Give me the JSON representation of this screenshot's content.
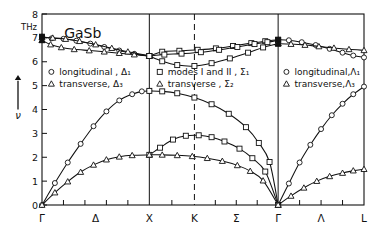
{
  "figure": {
    "title": "GaSb",
    "unit_label": "THz",
    "yaxis_symbol": "ν"
  },
  "chart_data": {
    "type": "line",
    "title": "GaSb",
    "xlabel": "",
    "ylabel": "ν",
    "yunit": "THz",
    "ylim": [
      0,
      8
    ],
    "yticks": [
      0,
      1,
      2,
      3,
      4,
      5,
      6,
      7,
      8
    ],
    "ytick_labels": [
      "0",
      "1",
      "2",
      "3",
      "4",
      "5",
      "6",
      "7",
      "8"
    ],
    "grid": false,
    "legend_position": "inside-upper-left",
    "xlim": [
      0,
      3.0
    ],
    "panel_boundaries": [
      0.0,
      1.0,
      1.42,
      2.2,
      3.0
    ],
    "panel_boundary_styles": [
      "solid",
      "solid",
      "dashed",
      "solid",
      "solid"
    ],
    "xtick_labels": [
      "Γ",
      "Δ",
      "X",
      "K",
      "Σ",
      "Γ",
      "Λ",
      "L"
    ],
    "xtick_positions": [
      0.0,
      0.5,
      1.0,
      1.42,
      1.81,
      2.2,
      2.6,
      3.0
    ],
    "xtick_label_kinds": [
      "point",
      "branch",
      "point",
      "point",
      "branch",
      "point",
      "branch",
      "point"
    ],
    "legend": [
      {
        "marker": "circle-open",
        "label": "longitudinal , Δ₁",
        "column": 1
      },
      {
        "marker": "triangle-open",
        "label": "transverse, Δ₃",
        "column": 1
      },
      {
        "marker": "square-open",
        "label": "modes I and II , Σ₁",
        "column": 2
      },
      {
        "marker": "triangle-open",
        "label": "transverse , Σ₂",
        "column": 2
      },
      {
        "marker": "circle-open",
        "label": "longitudinal,Λ₁",
        "column": 3
      },
      {
        "marker": "triangle-open",
        "label": "transverse,Λ₃",
        "column": 3
      }
    ],
    "series": [
      {
        "name": "LO Δ₁",
        "branch": "optic",
        "segment": "Gamma-X",
        "marker": "circle-open",
        "points": [
          [
            0.0,
            7.05
          ],
          [
            0.09,
            6.98
          ],
          [
            0.2,
            6.96
          ],
          [
            0.32,
            6.88
          ],
          [
            0.45,
            6.76
          ],
          [
            0.58,
            6.62
          ],
          [
            0.72,
            6.47
          ],
          [
            0.86,
            6.33
          ],
          [
            1.0,
            6.24
          ]
        ]
      },
      {
        "name": "TO Δ₃",
        "branch": "optic",
        "segment": "Gamma-X",
        "marker": "triangle-open",
        "points": [
          [
            0.0,
            6.9
          ],
          [
            0.08,
            6.72
          ],
          [
            0.18,
            6.6
          ],
          [
            0.3,
            6.52
          ],
          [
            0.44,
            6.47
          ],
          [
            0.58,
            6.42
          ],
          [
            0.72,
            6.36
          ],
          [
            0.86,
            6.3
          ],
          [
            1.0,
            6.24
          ]
        ]
      },
      {
        "name": "TO Δ₃ upper",
        "branch": "optic",
        "segment": "Gamma-X",
        "marker": "triangle-open",
        "points": [
          [
            0.0,
            7.02
          ],
          [
            0.1,
            7.0
          ],
          [
            0.22,
            6.95
          ],
          [
            0.35,
            6.86
          ],
          [
            0.5,
            6.72
          ],
          [
            0.65,
            6.57
          ],
          [
            0.8,
            6.42
          ],
          [
            1.0,
            6.26
          ]
        ]
      },
      {
        "name": "optic branch A Σ",
        "branch": "optic",
        "segment": "X-K-Sigma-Gamma",
        "marker": "square-open",
        "points": [
          [
            1.0,
            6.24
          ],
          [
            1.12,
            6.42
          ],
          [
            1.28,
            6.46
          ],
          [
            1.45,
            6.5
          ],
          [
            1.62,
            6.56
          ],
          [
            1.78,
            6.66
          ],
          [
            1.95,
            6.78
          ],
          [
            2.08,
            6.86
          ],
          [
            2.2,
            6.92
          ]
        ]
      },
      {
        "name": "optic branch B Σ",
        "branch": "optic",
        "segment": "X-K-Sigma-Gamma",
        "marker": "square-open",
        "points": [
          [
            1.0,
            6.24
          ],
          [
            1.14,
            6.3
          ],
          [
            1.3,
            6.34
          ],
          [
            1.48,
            6.4
          ],
          [
            1.65,
            6.5
          ],
          [
            1.82,
            6.62
          ],
          [
            1.98,
            6.74
          ],
          [
            2.1,
            6.82
          ],
          [
            2.2,
            6.9
          ]
        ]
      },
      {
        "name": "optic branch C Σ",
        "branch": "optic",
        "segment": "X-K-Sigma-Gamma",
        "marker": "square-open",
        "points": [
          [
            1.0,
            6.24
          ],
          [
            1.12,
            6.02
          ],
          [
            1.26,
            5.86
          ],
          [
            1.42,
            5.82
          ],
          [
            1.58,
            5.94
          ],
          [
            1.75,
            6.14
          ],
          [
            1.92,
            6.38
          ],
          [
            2.06,
            6.6
          ],
          [
            2.2,
            6.76
          ]
        ]
      },
      {
        "name": "LO Λ₁",
        "branch": "optic",
        "segment": "Gamma-L",
        "marker": "circle-open",
        "points": [
          [
            2.2,
            6.92
          ],
          [
            2.3,
            6.9
          ],
          [
            2.42,
            6.82
          ],
          [
            2.55,
            6.7
          ],
          [
            2.68,
            6.54
          ],
          [
            2.8,
            6.38
          ],
          [
            2.9,
            6.26
          ],
          [
            3.0,
            6.18
          ]
        ]
      },
      {
        "name": "TO Λ₃",
        "branch": "optic",
        "segment": "Gamma-L",
        "marker": "triangle-open",
        "points": [
          [
            2.2,
            6.76
          ],
          [
            2.32,
            6.74
          ],
          [
            2.45,
            6.7
          ],
          [
            2.58,
            6.64
          ],
          [
            2.72,
            6.58
          ],
          [
            2.86,
            6.52
          ],
          [
            3.0,
            6.48
          ]
        ]
      },
      {
        "name": "LA Δ₁",
        "branch": "acoustic",
        "segment": "Gamma-X",
        "marker": "circle-open",
        "points": [
          [
            0.0,
            0.0
          ],
          [
            0.12,
            0.92
          ],
          [
            0.24,
            1.78
          ],
          [
            0.36,
            2.56
          ],
          [
            0.48,
            3.3
          ],
          [
            0.6,
            3.92
          ],
          [
            0.72,
            4.38
          ],
          [
            0.84,
            4.64
          ],
          [
            0.93,
            4.76
          ],
          [
            1.0,
            4.78
          ]
        ]
      },
      {
        "name": "TA Δ₃",
        "branch": "acoustic",
        "segment": "Gamma-X",
        "marker": "triangle-open",
        "points": [
          [
            0.0,
            0.0
          ],
          [
            0.12,
            0.52
          ],
          [
            0.24,
            0.98
          ],
          [
            0.36,
            1.38
          ],
          [
            0.48,
            1.68
          ],
          [
            0.6,
            1.9
          ],
          [
            0.72,
            2.02
          ],
          [
            0.84,
            2.08
          ],
          [
            1.0,
            2.1
          ]
        ]
      },
      {
        "name": "LA Σ₁",
        "branch": "acoustic",
        "segment": "X-K-Sigma-Gamma",
        "marker": "square-open",
        "points": [
          [
            1.0,
            4.78
          ],
          [
            1.12,
            4.76
          ],
          [
            1.26,
            4.68
          ],
          [
            1.42,
            4.5
          ],
          [
            1.58,
            4.22
          ],
          [
            1.74,
            3.82
          ],
          [
            1.9,
            3.26
          ],
          [
            2.02,
            2.6
          ],
          [
            2.12,
            1.8
          ],
          [
            2.2,
            0.0
          ]
        ]
      },
      {
        "name": "mode II Σ₁",
        "branch": "acoustic",
        "segment": "X-K-Sigma-Gamma",
        "marker": "square-open",
        "points": [
          [
            1.0,
            2.1
          ],
          [
            1.1,
            2.4
          ],
          [
            1.22,
            2.74
          ],
          [
            1.34,
            2.9
          ],
          [
            1.46,
            2.92
          ],
          [
            1.58,
            2.84
          ],
          [
            1.7,
            2.66
          ],
          [
            1.84,
            2.36
          ],
          [
            1.96,
            1.96
          ],
          [
            2.08,
            1.4
          ],
          [
            2.2,
            0.0
          ]
        ]
      },
      {
        "name": "TA Σ₂",
        "branch": "acoustic",
        "segment": "X-K-Sigma-Gamma",
        "marker": "triangle-open",
        "points": [
          [
            1.0,
            2.1
          ],
          [
            1.12,
            2.1
          ],
          [
            1.26,
            2.08
          ],
          [
            1.4,
            2.04
          ],
          [
            1.54,
            1.96
          ],
          [
            1.68,
            1.84
          ],
          [
            1.82,
            1.66
          ],
          [
            1.94,
            1.42
          ],
          [
            2.06,
            1.02
          ],
          [
            2.2,
            0.0
          ]
        ]
      },
      {
        "name": "LA Λ₁",
        "branch": "acoustic",
        "segment": "Gamma-L",
        "marker": "circle-open",
        "points": [
          [
            2.2,
            0.0
          ],
          [
            2.3,
            0.9
          ],
          [
            2.4,
            1.78
          ],
          [
            2.5,
            2.52
          ],
          [
            2.6,
            3.18
          ],
          [
            2.7,
            3.76
          ],
          [
            2.8,
            4.24
          ],
          [
            2.9,
            4.64
          ],
          [
            3.0,
            4.96
          ]
        ]
      },
      {
        "name": "TA Λ₃",
        "branch": "acoustic",
        "segment": "Gamma-L",
        "marker": "triangle-open",
        "points": [
          [
            2.2,
            0.0
          ],
          [
            2.32,
            0.38
          ],
          [
            2.44,
            0.72
          ],
          [
            2.56,
            1.0
          ],
          [
            2.68,
            1.2
          ],
          [
            2.8,
            1.34
          ],
          [
            2.9,
            1.44
          ],
          [
            3.0,
            1.5
          ]
        ]
      }
    ],
    "filled_markers": [
      {
        "x": 0.0,
        "y": 7.05,
        "marker": "square-filled"
      },
      {
        "x": 0.0,
        "y": 6.9,
        "marker": "triangle-filled"
      },
      {
        "x": 2.2,
        "y": 6.92,
        "marker": "square-filled"
      },
      {
        "x": 2.2,
        "y": 6.76,
        "marker": "triangle-filled"
      }
    ]
  }
}
